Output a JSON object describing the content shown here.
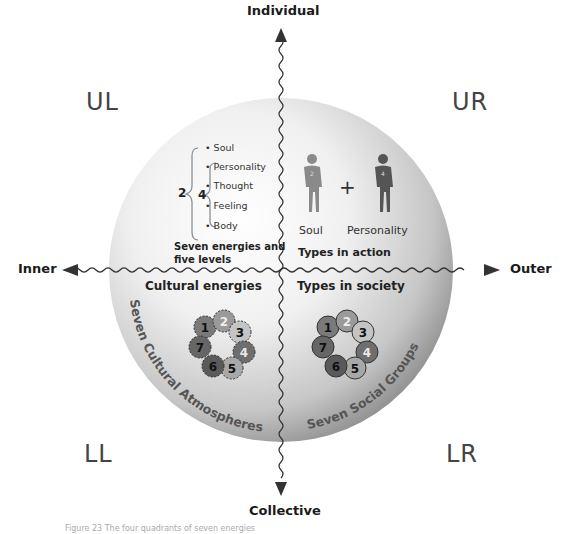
{
  "axes": {
    "top": "Individual",
    "bottom": "Collective",
    "left": "Inner",
    "right": "Outer"
  },
  "quadrants": {
    "ul": "UL",
    "ur": "UR",
    "ll": "LL",
    "lr": "LR"
  },
  "upper_left": {
    "outer_number": "2",
    "inner_number": "4",
    "levels": [
      "• Soul",
      "• Personality",
      "• Thought",
      "• Feeling",
      "• Body"
    ],
    "title_line1": "Seven energies and",
    "title_line2": "five levels"
  },
  "upper_right": {
    "figures": [
      {
        "label": "Soul",
        "badge": "2",
        "color": "#8a8a8a"
      },
      {
        "label": "Personality",
        "badge": "4",
        "color": "#555555"
      }
    ],
    "plus": "+",
    "title": "Types in action"
  },
  "lower_left": {
    "title": "Cultural energies",
    "arc_label": "Seven Cultural Atmospheres",
    "circles": [
      {
        "n": "1",
        "fill": "#7a7a7a",
        "text": "#111"
      },
      {
        "n": "2",
        "fill": "#9a9a9a",
        "text": "#eee"
      },
      {
        "n": "3",
        "fill": "#c4c4c4",
        "text": "#111"
      },
      {
        "n": "4",
        "fill": "#6e6e6e",
        "text": "#e8e8e8"
      },
      {
        "n": "5",
        "fill": "#a8a8a8",
        "text": "#111"
      },
      {
        "n": "6",
        "fill": "#5a5a5a",
        "text": "#111"
      },
      {
        "n": "7",
        "fill": "#666666",
        "text": "#111"
      }
    ]
  },
  "lower_right": {
    "title": "Types in society",
    "arc_label": "Seven Social Groups",
    "circles": [
      {
        "n": "1",
        "fill": "#7a7a7a",
        "text": "#111"
      },
      {
        "n": "2",
        "fill": "#9a9a9a",
        "text": "#eee"
      },
      {
        "n": "3",
        "fill": "#c4c4c4",
        "text": "#111"
      },
      {
        "n": "4",
        "fill": "#6e6e6e",
        "text": "#e8e8e8"
      },
      {
        "n": "5",
        "fill": "#a8a8a8",
        "text": "#111"
      },
      {
        "n": "6",
        "fill": "#5a5a5a",
        "text": "#111"
      },
      {
        "n": "7",
        "fill": "#666666",
        "text": "#111"
      }
    ]
  },
  "caption": "Figure 23 The four quadrants of seven energies"
}
